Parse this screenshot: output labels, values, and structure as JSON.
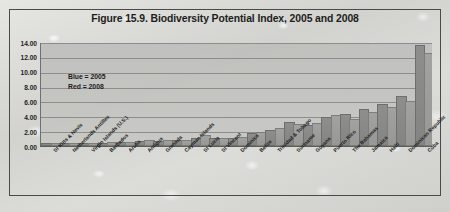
{
  "figure": {
    "title": "Figure 15.9. Biodiversity Potential Index, 2005 and 2008"
  },
  "legend": {
    "blue_label": "Blue = 2005",
    "red_label": "Red = 2008"
  },
  "axis": {
    "yticks": [
      "14.00",
      "12.00",
      "10.00",
      "8.00",
      "6.00",
      "4.00",
      "2.00",
      "0.00"
    ]
  },
  "colors": {
    "series_2005": "#8e8e8c",
    "series_2008": "#a2a2a0",
    "plot_background": "#c2c2bf",
    "gridline": "#8d8d8b",
    "text": "#1d1d1b",
    "frame": "#4a4a48",
    "page_background": "#d9d9d6"
  },
  "chart_data": {
    "type": "bar",
    "title": "Figure 15.9. Biodiversity Potential Index, 2005 and 2008",
    "xlabel": "",
    "ylabel": "",
    "ylim": [
      0,
      14
    ],
    "ytick_values": [
      0,
      2,
      4,
      6,
      8,
      10,
      12,
      14
    ],
    "grid": true,
    "legend_position": "inside-upper-left",
    "categories": [
      "St Kitts & Nevis",
      "Netherlands Antilles",
      "Virgin Islands (U.S.)",
      "Barbados",
      "Aruba",
      "Antigua",
      "Grenada",
      "Cayman Islands",
      "St Lucia",
      "St Vincent",
      "Dominica",
      "Belize",
      "Trinidad & Tobago",
      "Suriname",
      "Guyana",
      "Puerto Rico",
      "The Bahamas",
      "Jamaica",
      "Haiti",
      "Dominican Republic",
      "Cuba"
    ],
    "series": [
      {
        "name": "2005",
        "color": "#8e8e8c",
        "values": [
          0.06,
          0.12,
          0.14,
          0.2,
          0.22,
          0.42,
          0.46,
          0.5,
          0.82,
          0.78,
          0.8,
          1.5,
          1.95,
          2.9,
          2.6,
          3.6,
          4.05,
          4.65,
          5.45,
          6.45,
          13.35
        ]
      },
      {
        "name": "2008",
        "color": "#a2a2a0",
        "values": [
          0.08,
          0.16,
          0.16,
          0.24,
          0.26,
          0.6,
          0.48,
          0.5,
          1.18,
          0.82,
          0.88,
          1.6,
          2.1,
          2.7,
          2.85,
          3.85,
          3.35,
          4.25,
          5.05,
          5.75,
          12.25
        ]
      }
    ]
  }
}
